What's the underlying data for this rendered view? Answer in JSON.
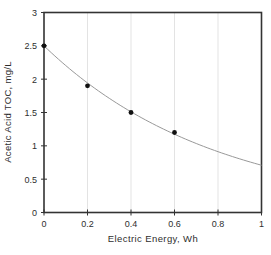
{
  "chart_data": {
    "type": "scatter",
    "title": "",
    "xlabel": "Electric Energy, Wh",
    "ylabel": "Acetic Acid TOC, mg/L",
    "xlim": [
      0,
      1
    ],
    "ylim": [
      0,
      3
    ],
    "x_ticks": [
      0,
      0.2,
      0.4,
      0.6,
      0.8,
      1
    ],
    "x_tick_labels": [
      "0",
      "0.2",
      "0.4",
      "0.6",
      "0.8",
      "1"
    ],
    "y_ticks": [
      0,
      0.5,
      1,
      1.5,
      2,
      2.5,
      3
    ],
    "y_tick_labels": [
      "0",
      "0.5",
      "1",
      "1.5",
      "2",
      "2.5",
      "3"
    ],
    "grid": "vertical-only",
    "legend": "none",
    "points": {
      "x": [
        0,
        0.2,
        0.4,
        0.6
      ],
      "y": [
        2.5,
        1.9,
        1.5,
        1.2
      ]
    },
    "curve": {
      "type": "exponential",
      "a": 2.5,
      "b": -1.26,
      "x_start": 0,
      "x_end": 1,
      "y_end": 0.7
    },
    "colors": {
      "axis": "#333333",
      "grid": "#e3e3e3",
      "curve": "#999999",
      "point": "#111111",
      "text": "#2e2e2e"
    }
  }
}
